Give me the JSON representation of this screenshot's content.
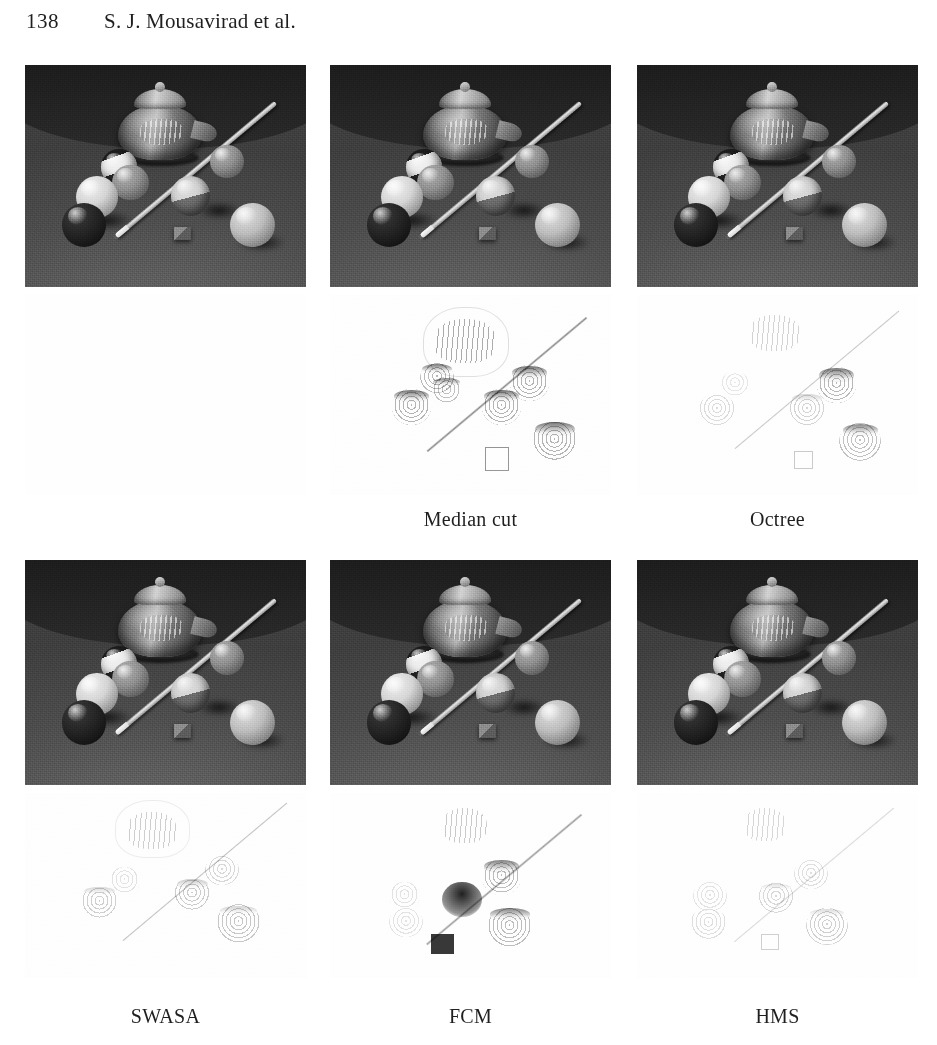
{
  "header": {
    "folio": "138",
    "running_title": "S. J. Mousavirad et al."
  },
  "figure": {
    "kind": "image-comparison-grid",
    "rows": 2,
    "columns": 3,
    "panel_label": "quantized result image",
    "error_label": "error / difference map",
    "scene_description": "grayscale still life: glass teapot, cue stick and seven billiard balls on a table",
    "grid": [
      {
        "row": 1,
        "cells": [
          {
            "caption": "",
            "has_image": true,
            "has_error_map": false,
            "error_intensity": 0
          },
          {
            "caption": "Median cut",
            "has_image": true,
            "has_error_map": true,
            "error_intensity": 0.85
          },
          {
            "caption": "Octree",
            "has_image": true,
            "has_error_map": true,
            "error_intensity": 0.35
          }
        ]
      },
      {
        "row": 2,
        "cells": [
          {
            "caption": "SWASA",
            "has_image": true,
            "has_error_map": true,
            "error_intensity": 0.45
          },
          {
            "caption": "FCM",
            "has_image": true,
            "has_error_map": true,
            "error_intensity": 0.7
          },
          {
            "caption": "HMS",
            "has_image": true,
            "has_error_map": true,
            "error_intensity": 0.3
          }
        ]
      }
    ],
    "captions": [
      "Median cut",
      "Octree",
      "SWASA",
      "FCM",
      "HMS"
    ]
  },
  "colors": {
    "page_background": "#ffffff",
    "text": "#1f1f1f",
    "photo_wall": "#1c1c1c",
    "photo_floor": "#5c5c5c",
    "error_background": "#fefefe"
  }
}
